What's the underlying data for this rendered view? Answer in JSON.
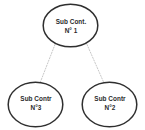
{
  "diagram": {
    "background_color": "#ffffff",
    "node_stroke_color": "#2f2f2f",
    "node_fill_color": "#ffffff",
    "connector_color": "#c8c8c8",
    "text_color": "#2b2b2b",
    "nodes": [
      {
        "id": "node-1",
        "role": "parent",
        "line1": "Sub Cont.",
        "line2": "N° 1",
        "shape": "ellipse",
        "cx": 70.5,
        "cy": 25.5,
        "rx": 27.5,
        "ry": 21.5
      },
      {
        "id": "node-3",
        "role": "child",
        "line1": "Sub Contr",
        "line2": "N°3",
        "shape": "ellipse",
        "cx": 35.5,
        "cy": 104.5,
        "rx": 27.5,
        "ry": 22.5
      },
      {
        "id": "node-2",
        "role": "child",
        "line1": "Sub Contr",
        "line2": "N°2",
        "shape": "ellipse",
        "cx": 109.5,
        "cy": 104.5,
        "rx": 27.5,
        "ry": 22.5
      }
    ],
    "connectors": [
      {
        "id": "connector-1-3",
        "from": "node-1",
        "to": "node-3",
        "style": "dotted",
        "x1": 55,
        "y1": 44,
        "x2": 40,
        "y2": 83
      },
      {
        "id": "connector-1-2",
        "from": "node-1",
        "to": "node-2",
        "style": "dotted",
        "x1": 87,
        "y1": 44,
        "x2": 104,
        "y2": 83
      }
    ]
  }
}
